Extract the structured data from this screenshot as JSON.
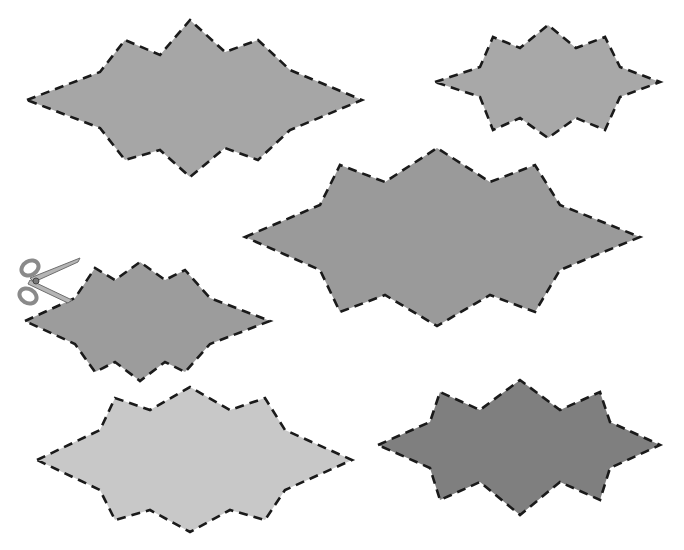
{
  "canvas": {
    "width": 684,
    "height": 550,
    "background": "#ffffff"
  },
  "outline": {
    "color": "#1a1a1a",
    "style": "dashed"
  },
  "shapes": [
    {
      "id": "shape-top-left",
      "fill": "#a6a6a6",
      "points": "27,100 100,72 125,40 160,55 190,20 225,52 258,40 290,70 362,100 290,130 258,160 225,148 190,177 160,150 125,160 100,128"
    },
    {
      "id": "shape-top-right",
      "fill": "#a8a8a8",
      "points": "435,82 480,67 493,37 520,48 548,25 576,48 605,37 620,67 660,82 620,97 605,130 576,118 548,138 520,118 493,130 480,97"
    },
    {
      "id": "shape-center",
      "fill": "#9a9a9a",
      "points": "245,237 320,205 340,165 385,182 437,148 490,182 535,165 560,205 640,237 560,270 535,312 490,295 437,326 385,295 340,312 320,270"
    },
    {
      "id": "shape-left-middle",
      "fill": "#9c9c9c",
      "points": "25,321 75,298 95,268 115,280 140,262 165,280 185,270 210,298 270,321 210,344 185,372 165,362 140,381 115,362 95,372 75,344"
    },
    {
      "id": "shape-bottom-left",
      "fill": "#c8c8c8",
      "points": "37,460 100,430 115,398 150,410 190,387 230,410 265,398 285,430 352,460 285,490 265,520 230,510 190,532 150,510 115,520 100,490"
    },
    {
      "id": "shape-bottom-right",
      "fill": "#7f7f7f",
      "points": "378,445 430,422 440,392 480,410 520,380 560,410 600,392 610,422 660,445 610,468 600,500 560,482 520,515 480,482 440,500 430,468"
    }
  ],
  "scissors": {
    "icon": "scissors-icon",
    "x": 22,
    "y": 258,
    "color": "#8a8a8a"
  }
}
